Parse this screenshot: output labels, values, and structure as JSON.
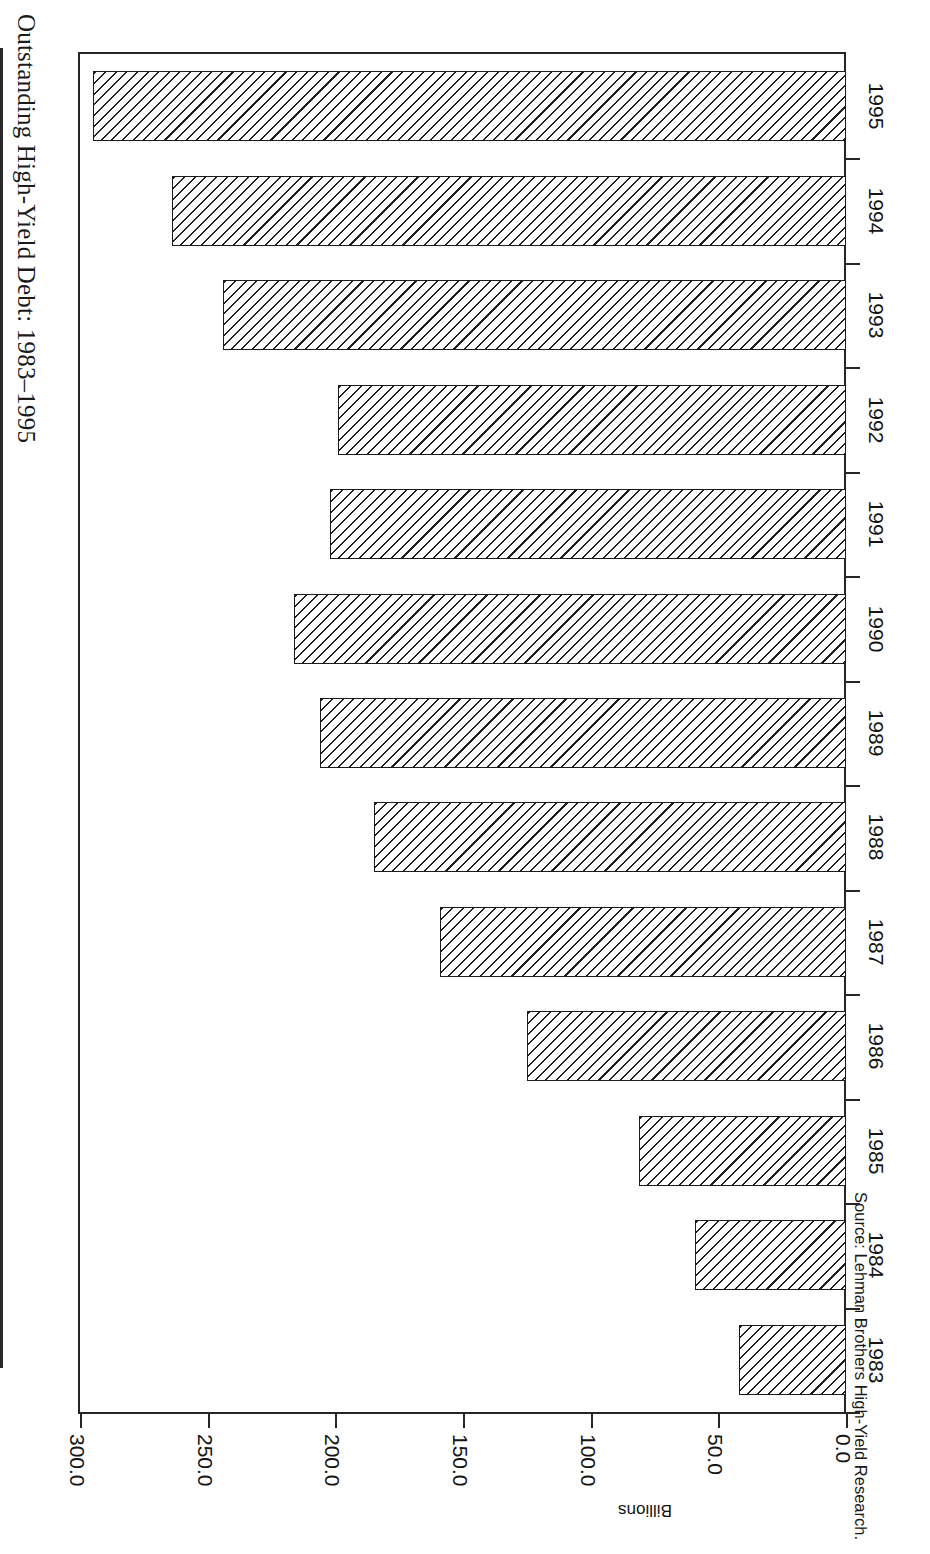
{
  "page": {
    "title": "Outstanding High-Yield Debt: 1983–1995",
    "source_note": "Source: Lehman Brothers High-Yield Research.",
    "orientation": "rotated-90",
    "background_color": "#ffffff",
    "ink_color": "#1a1a1a"
  },
  "chart_data": {
    "type": "bar",
    "title": "Outstanding High-Yield Debt: 1983–1995",
    "subtitle": "",
    "orientation": "horizontal",
    "xlabel": "",
    "ylabel": "Billions",
    "categories": [
      "1983",
      "1984",
      "1985",
      "1986",
      "1987",
      "1988",
      "1989",
      "1990",
      "1991",
      "1992",
      "1993",
      "1994",
      "1995"
    ],
    "values": [
      42.0,
      59.0,
      81.0,
      125.0,
      159.0,
      185.0,
      206.0,
      216.0,
      202.0,
      199.0,
      244.0,
      264.0,
      295.0
    ],
    "value_axis_ticks": [
      "300.0",
      "250.0",
      "200.0",
      "150.0",
      "100.0",
      "50.0",
      "0.0"
    ],
    "value_axis_tick_values": [
      300.0,
      250.0,
      200.0,
      150.0,
      100.0,
      50.0,
      0.0
    ],
    "ylim": [
      0,
      300
    ],
    "grid": false,
    "legend": null,
    "legend_position": "none",
    "series": [
      {
        "name": "Outstanding High-Yield Debt",
        "fill": "diagonal-hatch",
        "values": [
          42.0,
          59.0,
          81.0,
          125.0,
          159.0,
          185.0,
          206.0,
          216.0,
          202.0,
          199.0,
          244.0,
          264.0,
          295.0
        ]
      }
    ],
    "annotations": [],
    "units": "Billions of dollars"
  },
  "axis": {
    "value_axis_title": "Billions",
    "tick_labels": [
      "300.0",
      "250.0",
      "200.0",
      "150.0",
      "100.0",
      "50.0",
      "0.0"
    ],
    "category_labels": [
      "1995",
      "1994",
      "1993",
      "1992",
      "1991",
      "1990",
      "1989",
      "1988",
      "1987",
      "1986",
      "1985",
      "1984",
      "1983"
    ]
  }
}
